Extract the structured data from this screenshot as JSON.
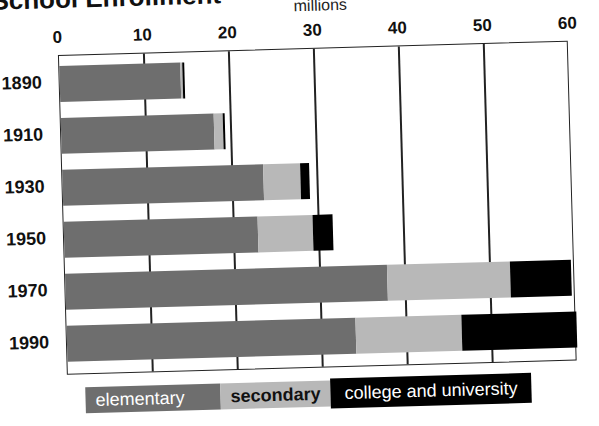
{
  "chart_data": {
    "type": "bar",
    "orientation": "horizontal",
    "stacked": true,
    "title": "School Enrollment",
    "xlabel": "millions",
    "ylabel": "",
    "xlim": [
      0,
      60
    ],
    "x_ticks": [
      "0",
      "10",
      "20",
      "30",
      "40",
      "50",
      "60"
    ],
    "categories": [
      "1890",
      "1910",
      "1930",
      "1950",
      "1970",
      "1990"
    ],
    "series": [
      {
        "name": "elementary",
        "color": "#6e6e6e",
        "values": [
          14.2,
          18.0,
          23.6,
          22.8,
          37.9,
          34.0
        ]
      },
      {
        "name": "secondary",
        "color": "#b8b8b8",
        "values": [
          0.3,
          1.0,
          4.4,
          6.5,
          14.5,
          12.5
        ]
      },
      {
        "name": "college and university",
        "color": "#000000",
        "values": [
          0.2,
          0.3,
          1.1,
          2.3,
          7.1,
          13.5
        ]
      }
    ],
    "grid": true,
    "legend_position": "bottom"
  }
}
